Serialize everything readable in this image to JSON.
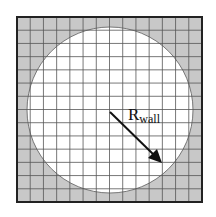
{
  "diagram": {
    "type": "grid-with-circular-wall",
    "grid": {
      "cells_per_side": 14,
      "x0": 17,
      "y0": 17,
      "size": 185
    },
    "circle": {
      "cx": 110,
      "cy": 110,
      "r": 83
    },
    "label": {
      "main": "R",
      "subscript": "wall"
    },
    "arrow": {
      "x1": 110,
      "y1": 112,
      "x2": 162,
      "y2": 163
    },
    "colors": {
      "outside_fill": "#c8c8c8",
      "inside_fill": "#ffffff",
      "grid_line": "#555555",
      "border": "#222222",
      "arrow": "#111111"
    }
  }
}
